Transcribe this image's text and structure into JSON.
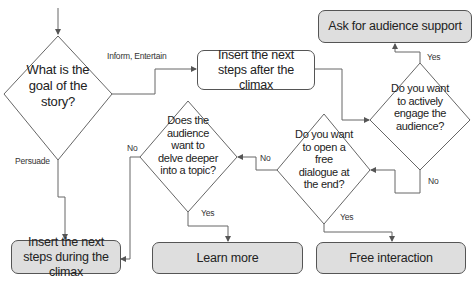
{
  "diagram": {
    "type": "flowchart",
    "decisions": {
      "goal": "What is the goal of the story?",
      "engage": "Do you want to actively engage the audience?",
      "dialogue": "Do you want to open a free dialogue at the end?",
      "delve": "Does the audience want to delve deeper into a topic?"
    },
    "actions": {
      "after_climax": "Insert the next steps after the climax",
      "ask_support": "Ask for audience support",
      "during_climax": "Insert the next steps during the climax",
      "learn_more": "Learn more",
      "free_interaction": "Free interaction"
    },
    "edge_labels": {
      "inform_entertain": "Inform, Entertain",
      "persuade": "Persuade",
      "engage_yes": "Yes",
      "engage_no": "No",
      "dialogue_yes": "Yes",
      "dialogue_no": "No",
      "delve_yes": "Yes",
      "delve_no": "No"
    },
    "colors": {
      "line": "#555555",
      "terminal_fill": "#dedede",
      "process_fill": "#ffffff"
    }
  }
}
